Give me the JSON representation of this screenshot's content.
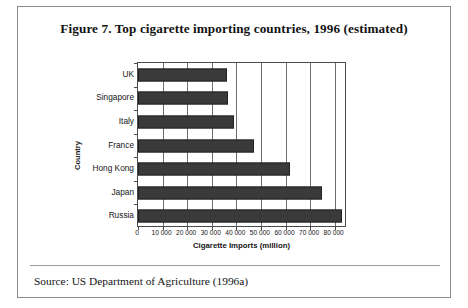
{
  "figure": {
    "title": "Figure 7. Top cigarette importing countries, 1996 (estimated)",
    "source_note": "Source: US Department of Agriculture (1996a)"
  },
  "chart_data": {
    "type": "bar",
    "orientation": "horizontal",
    "title": "Figure 7. Top cigarette importing countries, 1996 (estimated)",
    "xlabel": "Cigarette Imports (million)",
    "ylabel": "Country",
    "categories": [
      "Russia",
      "Japan",
      "Hong Kong",
      "France",
      "Italy",
      "Singapore",
      "UK"
    ],
    "values": [
      83000,
      75000,
      62000,
      47000,
      39000,
      36500,
      36000
    ],
    "xlim": [
      0,
      85000
    ],
    "xticks": [
      0,
      10000,
      20000,
      30000,
      40000,
      50000,
      60000,
      70000,
      80000
    ],
    "xtick_labels": [
      "0",
      "10 000",
      "20 000",
      "30 000",
      "40 000",
      "50 000",
      "60 000",
      "70 000",
      "80 000"
    ],
    "grid": "vertical",
    "legend": "none",
    "bar_color": "#3a3a3a"
  }
}
